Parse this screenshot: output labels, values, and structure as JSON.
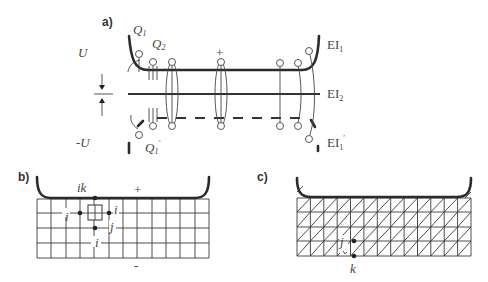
{
  "figure": {
    "panel_a": {
      "label": "a)",
      "potential_top": "U",
      "potential_bottom": "-U",
      "charge_q1": "Q",
      "charge_q1_sub": "1",
      "charge_q2": "Q",
      "charge_q2_sub": "2",
      "charge_q1_prime": "Q",
      "charge_q1_prime_sub": "1",
      "charge_q1_prime_mark": "′",
      "plus_sign": "+",
      "electrode_top": "EI",
      "electrode_top_sub": "1",
      "electrode_mid": "EI",
      "electrode_mid_sub": "2",
      "electrode_bottom": "EI",
      "electrode_bottom_sub": "1",
      "electrode_bottom_mark": "′"
    },
    "panel_b": {
      "label": "b)",
      "node_ik": "ik",
      "node_i_left": "i",
      "node_i_right": "i",
      "node_j": "j",
      "node_i_bottom": "i",
      "plus_sign": "+",
      "minus_sign": "-",
      "grid_columns": 12,
      "grid_rows": 4
    },
    "panel_c": {
      "label": "c)",
      "node_j": "j",
      "node_k": "k",
      "grid_columns": 13,
      "grid_rows": 4,
      "mesh": "triangular"
    }
  }
}
